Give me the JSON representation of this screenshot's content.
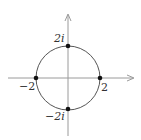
{
  "diagram": {
    "title": "",
    "type": "complex-plane-circle",
    "center": [
      0,
      0
    ],
    "radius": 2,
    "points": [
      {
        "label": "2i",
        "re": 0,
        "im": 2
      },
      {
        "label": "−2",
        "re": -2,
        "im": 0
      },
      {
        "label": "2",
        "re": 2,
        "im": 0
      },
      {
        "label": "−2i",
        "re": 0,
        "im": -2
      }
    ],
    "axes": {
      "horizontal": "real",
      "vertical": "imaginary",
      "arrows": true
    },
    "colors": {
      "axis": "#9a9a9a",
      "circle": "#555555",
      "point": "#111111",
      "text": "#333333"
    }
  }
}
